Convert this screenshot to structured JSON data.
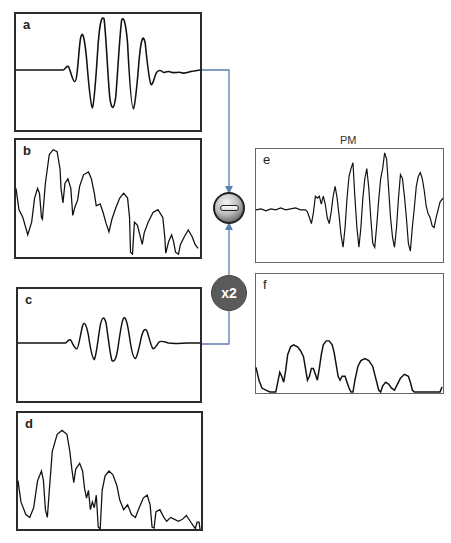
{
  "figure": {
    "panels": {
      "a": {
        "label": "a",
        "description": "Time-domain wave packet (reference signal)"
      },
      "b": {
        "label": "b",
        "description": "Frequency spectrum of signal a"
      },
      "c": {
        "label": "c",
        "description": "Time-domain wave packet (second signal, scaled x2 before subtraction)"
      },
      "d": {
        "label": "d",
        "description": "Frequency spectrum of signal c"
      },
      "e": {
        "label": "e",
        "title": "PM",
        "description": "Resulting difference signal"
      },
      "f": {
        "label": "f",
        "description": "Frequency spectrum of signal e"
      }
    },
    "operators": {
      "subtract": {
        "symbol": "minus",
        "label": ""
      },
      "scale": {
        "label": "x2"
      }
    },
    "colors": {
      "connector": "#5b7fae",
      "frame_left": "#2b2b2b",
      "frame_right": "#666666",
      "trace": "#111111",
      "scale_circle": "#5a5a5a"
    }
  }
}
